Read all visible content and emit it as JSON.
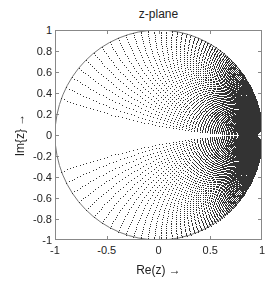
{
  "chart_data": {
    "type": "scatter",
    "title": "z-plane",
    "xlabel": "Re(z) →",
    "ylabel": "Im{z} →",
    "xlim": [
      -1,
      1
    ],
    "ylim": [
      -1,
      1
    ],
    "grid": false,
    "legend": null,
    "xticks": [
      -1,
      -0.5,
      0,
      0.5,
      1
    ],
    "xtick_labels": [
      "-1",
      "-0.5",
      "0",
      "0.5",
      "1"
    ],
    "yticks": [
      1,
      0.8,
      0.6,
      0.4,
      0.2,
      0,
      -0.2,
      -0.4,
      -0.6,
      -0.8,
      -1
    ],
    "ytick_labels": [
      "1",
      "0.8",
      "0.6",
      "0.4",
      "0.2",
      "0",
      "-0.2",
      "-0.4",
      "-0.6",
      "-0.8",
      "-1"
    ],
    "series": [
      {
        "name": "unit circle",
        "kind": "line",
        "description": "|z| = 1",
        "center": [
          0,
          0
        ],
        "radius": 1,
        "color": "#777777"
      },
      {
        "name": "mapped s-plane grid points",
        "kind": "dots",
        "description": "Left-half s-plane grid points s = sigma + j*omega mapped into the unit disk; constant-omega curves start on the unit circle and converge at z = 1, constant-sigma curves form nested rings tangent at z = 1",
        "mapping": "z = (s + 1) / (s - 1)",
        "sigma": {
          "min": 0,
          "max_magnitude": 40,
          "growth": 0.055,
          "offset": 0.27,
          "count": 92
        },
        "omega": {
          "start": 0.18,
          "step": 0.06,
          "max": 40,
          "symmetric": true
        },
        "convergence_point": [
          1,
          0
        ],
        "color": "#333333"
      }
    ]
  },
  "axes": {
    "plot_left": 55,
    "plot_top": 30,
    "plot_width": 207,
    "plot_height": 210
  }
}
